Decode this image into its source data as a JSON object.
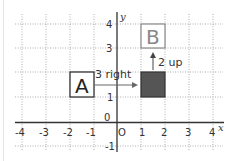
{
  "axes": {
    "x_label": "x",
    "y_label": "y",
    "origin_label": "O",
    "x_ticks": [
      "-4",
      "-3",
      "-2",
      "-1",
      "1",
      "2",
      "3",
      "4"
    ],
    "y_ticks": [
      "4",
      "3",
      "1",
      "-1"
    ],
    "y_tick_zero": "0"
  },
  "shapes": {
    "A": {
      "label": "A",
      "x": [
        -2,
        -1
      ],
      "y": [
        1,
        2
      ]
    },
    "intermediate": {
      "x": [
        1,
        2
      ],
      "y": [
        1,
        2
      ],
      "fill": "#555555"
    },
    "B": {
      "label": "B",
      "x": [
        1,
        2
      ],
      "y": [
        3,
        4
      ]
    }
  },
  "translations": {
    "horizontal": "3 right",
    "vertical": "2 up"
  },
  "colors": {
    "grid": "#9a9a9a",
    "axis": "#333333",
    "A_border": "#222222",
    "B_border": "#888888",
    "B_text": "#888888",
    "filled": "#555555"
  }
}
